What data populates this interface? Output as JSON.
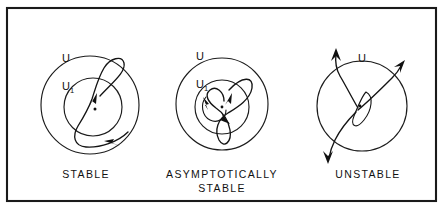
{
  "figure": {
    "background_color": "#ffffff",
    "ink_color": "#111111",
    "frame": {
      "name": "figure-border",
      "x": 7,
      "y": 8,
      "width": 429,
      "height": 193
    }
  },
  "panels": [
    {
      "id": "stable",
      "caption_lines": [
        "STABLE"
      ],
      "caption_x": 86,
      "caption_y": 178,
      "outer_circle": {
        "label": "U",
        "cx": 90,
        "cy": 105,
        "r": 49
      },
      "inner_circle": {
        "label": "U",
        "sub": "1",
        "cx": 93,
        "cy": 107,
        "r": 29
      },
      "outer_label_pos": {
        "x": 62,
        "y": 62
      },
      "inner_label_pos": {
        "x": 62,
        "y": 90
      },
      "center_dot": {
        "cx": 95,
        "cy": 109,
        "r": 1.5
      },
      "trajectory_kind": "bounded-orbit",
      "arrow_count": 2
    },
    {
      "id": "asymptotically-stable",
      "caption_lines": [
        "ASYMPTOTICALLY",
        "STABLE"
      ],
      "caption_x": 222,
      "caption_y": 178,
      "outer_circle": {
        "label": "U",
        "cx": 222,
        "cy": 104,
        "r": 46
      },
      "inner_circle": {
        "label": "U",
        "sub": "1",
        "cx": 222,
        "cy": 107,
        "r": 27
      },
      "outer_label_pos": {
        "x": 196,
        "y": 60
      },
      "inner_label_pos": {
        "x": 196,
        "y": 88
      },
      "center_dot": {
        "cx": 222,
        "cy": 107,
        "r": 1.4
      },
      "trajectory_kind": "inward-spiral",
      "arrow_count": 3
    },
    {
      "id": "unstable",
      "caption_lines": [
        "UNSTABLE"
      ],
      "caption_x": 368,
      "caption_y": 178,
      "outer_circle": {
        "label": "U",
        "cx": 362,
        "cy": 106,
        "r": 45
      },
      "outer_label_pos": {
        "x": 362,
        "y": 62
      },
      "center_dot": {
        "cx": 360,
        "cy": 106,
        "r": 1.4
      },
      "trajectory_kind": "outward-escape",
      "arrow_count": 3
    }
  ],
  "captions": {
    "stable": "STABLE",
    "asymptotically_line1": "ASYMPTOTICALLY",
    "asymptotically_line2": "STABLE",
    "unstable": "UNSTABLE"
  },
  "labels": {
    "u": "U",
    "u_subscript": "1"
  }
}
